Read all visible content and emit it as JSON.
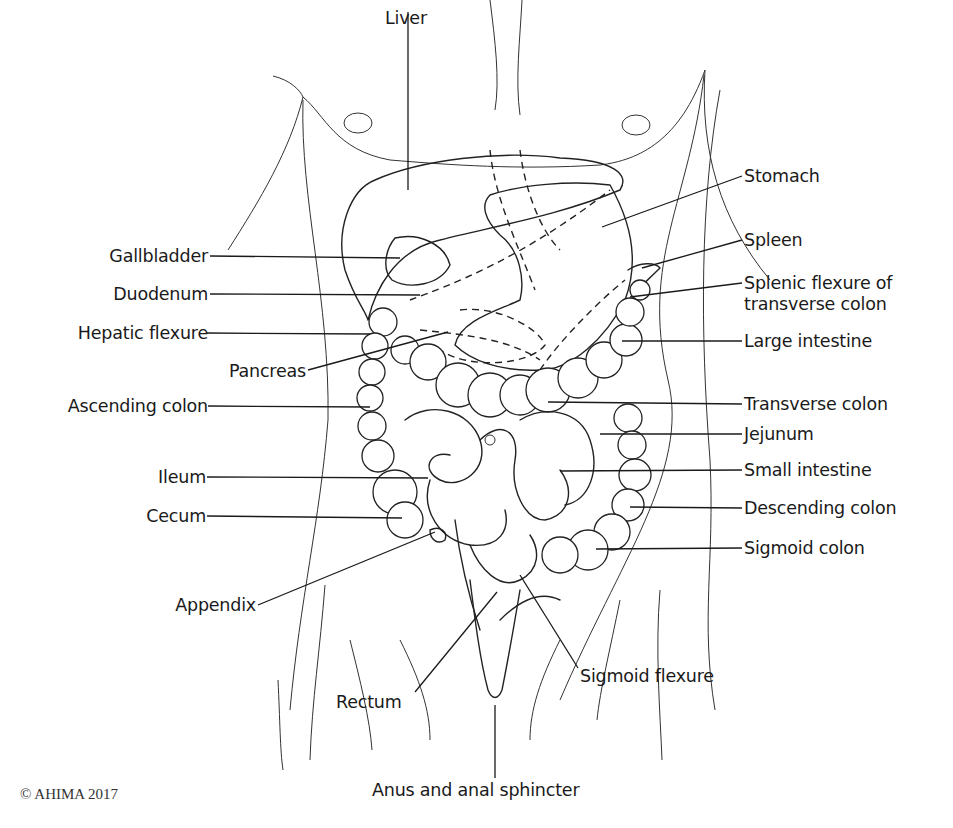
{
  "diagram": {
    "labels_left": [
      {
        "id": "gallbladder",
        "text": "Gallbladder"
      },
      {
        "id": "duodenum",
        "text": "Duodenum"
      },
      {
        "id": "hepatic_flexure",
        "text": "Hepatic flexure"
      },
      {
        "id": "pancreas",
        "text": "Pancreas"
      },
      {
        "id": "ascending_colon",
        "text": "Ascending colon"
      },
      {
        "id": "ileum",
        "text": "Ileum"
      },
      {
        "id": "cecum",
        "text": "Cecum"
      },
      {
        "id": "appendix",
        "text": "Appendix"
      }
    ],
    "labels_right": [
      {
        "id": "stomach",
        "text": "Stomach"
      },
      {
        "id": "spleen",
        "text": "Spleen"
      },
      {
        "id": "splenic_flexure",
        "text": "Splenic flexure of",
        "text2": "transverse colon"
      },
      {
        "id": "large_intestine",
        "text": "Large intestine"
      },
      {
        "id": "transverse_colon",
        "text": "Transverse colon"
      },
      {
        "id": "jejunum",
        "text": "Jejunum"
      },
      {
        "id": "small_intestine",
        "text": "Small intestine"
      },
      {
        "id": "descending_colon",
        "text": "Descending colon"
      },
      {
        "id": "sigmoid_colon",
        "text": "Sigmoid colon"
      }
    ],
    "labels_top": [
      {
        "id": "liver",
        "text": "Liver"
      }
    ],
    "labels_bottom": [
      {
        "id": "rectum",
        "text": "Rectum"
      },
      {
        "id": "sigmoid_flexure",
        "text": "Sigmoid flexure"
      },
      {
        "id": "anus",
        "text": "Anus and anal sphincter"
      }
    ],
    "copyright": "© AHIMA 2017"
  }
}
